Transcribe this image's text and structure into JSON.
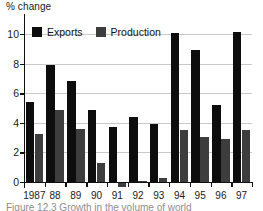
{
  "figure": {
    "y_axis_title": "% change",
    "caption": "Figure 12.3  Growth in the volume of world"
  },
  "legend": {
    "position": "top-left-inside",
    "items": [
      {
        "label": "Exports",
        "color": "#0d0d0d",
        "swatch": "black-square-icon"
      },
      {
        "label": "Production",
        "color": "#3d3d3d",
        "swatch": "gray-square-icon"
      }
    ]
  },
  "chart_data": {
    "type": "bar",
    "title": "",
    "subtitle": "",
    "xlabel": "",
    "ylabel": "% change",
    "categories": [
      "1987",
      "88",
      "89",
      "90",
      "91",
      "92",
      "93",
      "94",
      "95",
      "96",
      "97"
    ],
    "series": [
      {
        "name": "Exports",
        "color": "#0d0d0d",
        "values": [
          5.4,
          7.9,
          6.8,
          4.85,
          3.75,
          4.4,
          3.9,
          10.1,
          8.9,
          5.2,
          10.15
        ]
      },
      {
        "name": "Production",
        "color": "#3d3d3d",
        "values": [
          3.25,
          4.85,
          3.55,
          1.3,
          -0.35,
          0.05,
          0.25,
          3.5,
          3.05,
          2.9,
          3.5
        ]
      }
    ],
    "ylim": [
      0,
      10
    ],
    "yticks": [
      0,
      2,
      4,
      6,
      8,
      10
    ],
    "ytick_labels": [
      "0",
      "2",
      "4",
      "6",
      "8",
      "10"
    ],
    "grid": true,
    "grid_axis": "y",
    "legend_position": "upper left"
  }
}
